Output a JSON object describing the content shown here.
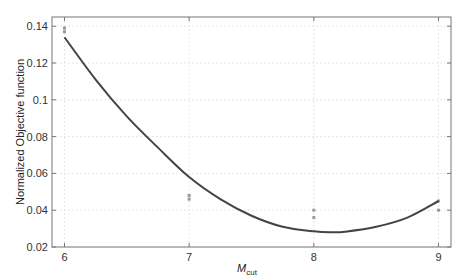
{
  "chart_data": {
    "type": "line",
    "title": "",
    "xlabel": "M",
    "xlabel_subscript": "cut",
    "ylabel": "Normalized Objective function",
    "xlim": [
      5.9,
      9.1
    ],
    "ylim": [
      0.02,
      0.145
    ],
    "xticks": [
      6,
      7,
      8,
      9
    ],
    "xtick_labels": [
      "6",
      "7",
      "8",
      "9"
    ],
    "yticks": [
      0.02,
      0.04,
      0.06,
      0.08,
      0.1,
      0.12,
      0.14
    ],
    "ytick_labels": [
      "0.02",
      "0.04",
      "0.06",
      "0.08",
      "0.1",
      "0.12",
      "0.14"
    ],
    "grid": true,
    "legend": null,
    "series": [
      {
        "name": "fit curve",
        "kind": "line",
        "color": "#444444",
        "x": [
          6.0,
          6.25,
          6.5,
          6.75,
          7.0,
          7.25,
          7.5,
          7.75,
          8.0,
          8.15,
          8.25,
          8.5,
          8.75,
          9.0
        ],
        "values": [
          0.134,
          0.111,
          0.091,
          0.074,
          0.058,
          0.046,
          0.037,
          0.031,
          0.0285,
          0.028,
          0.0283,
          0.031,
          0.036,
          0.045
        ]
      },
      {
        "name": "data points",
        "kind": "scatter",
        "color": "#999999",
        "x": [
          6,
          6,
          7,
          7,
          8,
          8,
          9,
          9
        ],
        "values": [
          0.139,
          0.137,
          0.048,
          0.046,
          0.04,
          0.036,
          0.045,
          0.04
        ]
      }
    ]
  }
}
